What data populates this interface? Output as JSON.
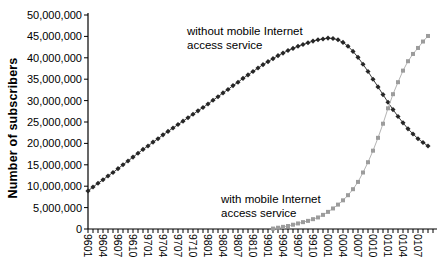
{
  "chart": {
    "y_axis_title": "Number of subscribers",
    "annotation_without": {
      "line1": "without mobile Internet",
      "line2": "access service"
    },
    "annotation_with": {
      "line1": "with mobile Internet",
      "line2": "access service"
    }
  },
  "colors": {
    "background": "#ffffff",
    "axis": "#000000",
    "without_marker": "#262626",
    "without_line": "#3d3d3d",
    "with_marker": "#9c9c9c",
    "with_line": "#b4b4b4",
    "text": "#000000"
  },
  "chart_data": {
    "type": "line",
    "title": "",
    "xlabel": "",
    "ylabel": "Number of subscribers",
    "ylim": [
      0,
      50000000
    ],
    "y_tick_step": 5000000,
    "y_tick_labels": [
      "0",
      "5,000,000",
      "10,000,000",
      "15,000,000",
      "20,000,000",
      "25,000,000",
      "30,000,000",
      "35,000,000",
      "40,000,000",
      "45,000,000",
      "50,000,000"
    ],
    "x_tick_label_every": 3,
    "grid": "off",
    "legend_position": "inline-annotations",
    "units": "subscribers (values_millions are millions of subscribers)",
    "x": [
      "9601",
      "9602",
      "9603",
      "9604",
      "9605",
      "9606",
      "9607",
      "9608",
      "9609",
      "9610",
      "9611",
      "9612",
      "9701",
      "9702",
      "9703",
      "9704",
      "9705",
      "9706",
      "9707",
      "9708",
      "9709",
      "9710",
      "9711",
      "9712",
      "9801",
      "9802",
      "9803",
      "9804",
      "9805",
      "9806",
      "9807",
      "9808",
      "9809",
      "9810",
      "9811",
      "9812",
      "9901",
      "9902",
      "9903",
      "9904",
      "9905",
      "9906",
      "9907",
      "9908",
      "9909",
      "9910",
      "9911",
      "9912",
      "0001",
      "0002",
      "0003",
      "0004",
      "0005",
      "0006",
      "0007",
      "0008",
      "0009",
      "0010",
      "0011",
      "0012",
      "0101",
      "0102",
      "0103",
      "0104",
      "0105",
      "0106",
      "0107",
      "0108",
      "0109"
    ],
    "series": [
      {
        "name": "without mobile Internet access service",
        "marker": "diamond",
        "values_millions": [
          8.9,
          9.8,
          10.7,
          11.5,
          12.4,
          13.2,
          14.1,
          15.0,
          15.9,
          16.8,
          17.7,
          18.6,
          19.4,
          20.3,
          21.1,
          22.0,
          22.8,
          23.6,
          24.4,
          25.2,
          26.0,
          26.8,
          27.6,
          28.4,
          29.2,
          30.1,
          30.9,
          31.8,
          32.6,
          33.5,
          34.3,
          35.2,
          36.0,
          36.8,
          37.6,
          38.4,
          39.1,
          39.8,
          40.5,
          41.1,
          41.7,
          42.2,
          42.7,
          43.1,
          43.5,
          43.9,
          44.2,
          44.4,
          44.6,
          44.5,
          44.2,
          43.6,
          42.7,
          41.5,
          40.1,
          38.5,
          36.8,
          35.0,
          33.2,
          31.4,
          29.6,
          27.9,
          26.3,
          24.8,
          23.4,
          22.2,
          21.1,
          20.2,
          19.4
        ]
      },
      {
        "name": "with mobile Internet access service",
        "marker": "square",
        "values_millions": [
          null,
          null,
          null,
          null,
          null,
          null,
          null,
          null,
          null,
          null,
          null,
          null,
          null,
          null,
          null,
          null,
          null,
          null,
          null,
          null,
          null,
          null,
          null,
          null,
          null,
          null,
          null,
          null,
          null,
          null,
          null,
          null,
          null,
          null,
          null,
          null,
          null,
          0.1,
          0.3,
          0.5,
          0.7,
          1.0,
          1.3,
          1.6,
          1.9,
          2.3,
          2.7,
          3.3,
          4.0,
          4.8,
          5.7,
          6.7,
          7.9,
          9.3,
          11.0,
          13.2,
          15.6,
          18.3,
          21.3,
          24.6,
          28.2,
          31.5,
          34.3,
          37.0,
          39.2,
          40.9,
          42.3,
          43.8,
          45.1
        ]
      }
    ]
  }
}
